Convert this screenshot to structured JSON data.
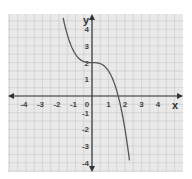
{
  "chart_data": {
    "type": "line",
    "title": "",
    "xlabel": "x",
    "ylabel": "y",
    "xlim": [
      -5,
      5
    ],
    "ylim": [
      -4.8,
      4.8
    ],
    "x_ticks": [
      "-4",
      "-3",
      "-2",
      "-1",
      "0",
      "1",
      "2",
      "3",
      "4"
    ],
    "y_ticks": [
      "4",
      "3",
      "2",
      "1",
      "-1",
      "-2",
      "-3",
      "-4"
    ],
    "grid": true,
    "grid_step": 0.5,
    "series": [
      {
        "name": "curve",
        "function": "y = -0.5x^3 + 2",
        "x": [
          -1.75,
          -1.5,
          -1.25,
          -1,
          -0.5,
          0,
          0.5,
          1,
          1.25,
          1.5,
          1.59,
          1.75,
          2,
          2.29
        ],
        "y": [
          4.68,
          3.69,
          2.98,
          2.5,
          2.06,
          2,
          1.94,
          1.5,
          1.02,
          0.31,
          0,
          -0.68,
          -2,
          -4
        ]
      }
    ],
    "colors": {
      "background": "#e9e9e9",
      "grid": "#c8c8c8",
      "axis": "#333333",
      "curve": "#555555"
    }
  }
}
